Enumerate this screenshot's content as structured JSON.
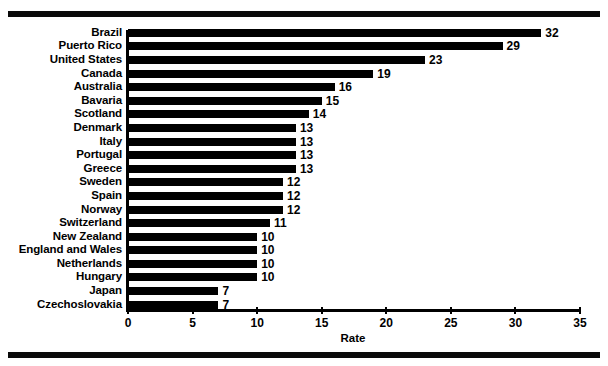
{
  "chart_data": {
    "type": "bar",
    "orientation": "horizontal",
    "title": "",
    "xlabel": "Rate",
    "ylabel": "",
    "xlim": [
      0,
      35
    ],
    "xticks": [
      0,
      5,
      10,
      15,
      20,
      25,
      30,
      35
    ],
    "grid": false,
    "legend": null,
    "bar_color": "#000000",
    "background_color": "#ffffff",
    "categories": [
      "Brazil",
      "Puerto Rico",
      "United States",
      "Canada",
      "Australia",
      "Bavaria",
      "Scotland",
      "Denmark",
      "Italy",
      "Portugal",
      "Greece",
      "Sweden",
      "Spain",
      "Norway",
      "Switzerland",
      "New Zealand",
      "England and Wales",
      "Netherlands",
      "Hungary",
      "Japan",
      "Czechoslovakia"
    ],
    "values": [
      32,
      29,
      23,
      19,
      16,
      15,
      14,
      13,
      13,
      13,
      13,
      12,
      12,
      12,
      11,
      10,
      10,
      10,
      10,
      7,
      7
    ],
    "data_labels": [
      "32",
      "29",
      "23",
      "19",
      "16",
      "15",
      "14",
      "13",
      "13",
      "13",
      "13",
      "12",
      "12",
      "12",
      "11",
      "10",
      "10",
      "10",
      "10",
      "7",
      "7"
    ],
    "tick_labels": [
      "0",
      "5",
      "10",
      "15",
      "20",
      "25",
      "30",
      "35"
    ]
  }
}
